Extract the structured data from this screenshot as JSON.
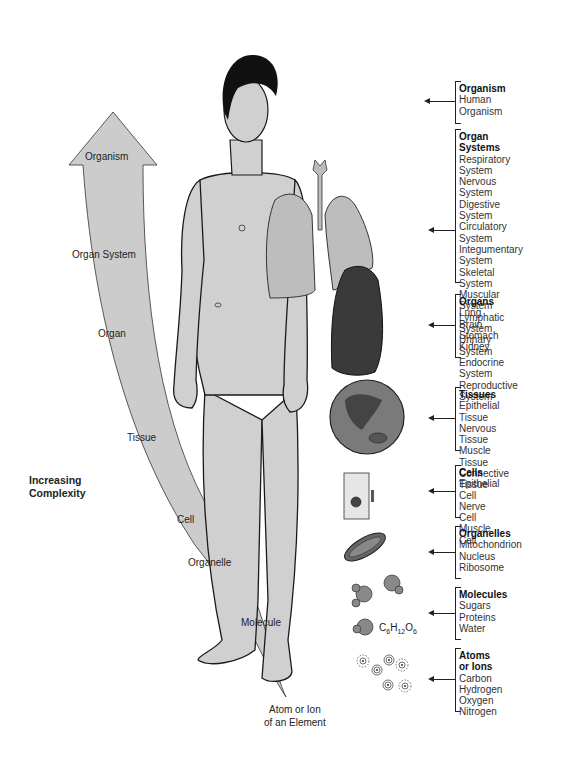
{
  "figure": {
    "side_label": [
      "Increasing",
      "Complexity"
    ],
    "arrow_levels": [
      {
        "label": "Organism"
      },
      {
        "label": "Organ System"
      },
      {
        "label": "Organ"
      },
      {
        "label": "Tissue"
      },
      {
        "label": "Cell"
      },
      {
        "label": "Organelle"
      },
      {
        "label": "Molecule"
      }
    ],
    "arrow_tip_label": [
      "Atom or Ion",
      "of an Element"
    ],
    "formula": {
      "c": "C",
      "c_n": "6",
      "h": "H",
      "h_n": "12",
      "o": "O",
      "o_n": "6"
    },
    "colors": {
      "arrow_fill": "#cccccc",
      "skin_fill": "#d0d0d0",
      "lung_light": "#bdbdbd",
      "lung_dark": "#3a3a3a",
      "outline": "#1a1a1a"
    }
  },
  "groups": [
    {
      "title": "Organism",
      "items": [
        "Human Organism"
      ]
    },
    {
      "title": "Organ Systems",
      "items": [
        "Respiratory System",
        "Nervous System",
        "Digestive System",
        "Circulatory System",
        "Integumentary System",
        "Skeletal System",
        "Muscular System",
        "Lymphatic System",
        "Urinary System",
        "Endocrine System",
        "Reproductive System"
      ]
    },
    {
      "title": "Organs",
      "items": [
        "Lung",
        "Brain",
        "Stomach",
        "Kidney"
      ]
    },
    {
      "title": "Tissues",
      "items": [
        "Epithelial Tissue",
        "Nervous Tissue",
        "Muscle Tissue",
        "Connective Tissue"
      ]
    },
    {
      "title": "Cells",
      "items": [
        "Epithelial Cell",
        "Nerve Cell",
        "Muscle Cell"
      ]
    },
    {
      "title": "Organelles",
      "items": [
        "Mitochondrion",
        "Nucleus",
        "Ribosome"
      ]
    },
    {
      "title": "Molecules",
      "items": [
        "Sugars",
        "Proteins",
        "Water"
      ]
    },
    {
      "title": "Atoms or Ions",
      "items": [
        "Carbon",
        "Hydrogen",
        "Oxygen",
        "Nitrogen"
      ]
    }
  ]
}
